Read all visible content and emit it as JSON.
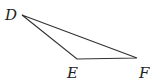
{
  "diagram": {
    "type": "triangle",
    "vertices": [
      {
        "label": "D",
        "x": 22,
        "y": 15
      },
      {
        "label": "E",
        "x": 77,
        "y": 59
      },
      {
        "label": "F",
        "x": 137,
        "y": 58
      }
    ],
    "edges": [
      [
        "D",
        "E"
      ],
      [
        "E",
        "F"
      ],
      [
        "F",
        "D"
      ]
    ],
    "stroke_color": "#333333"
  }
}
